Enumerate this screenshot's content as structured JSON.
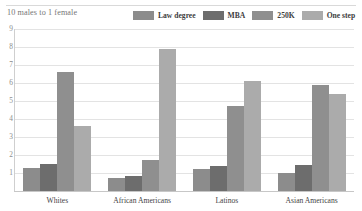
{
  "chart_data": {
    "type": "bar",
    "title": "10 males to 1 female",
    "xlabel": "",
    "ylabel": "",
    "ylim": [
      0,
      9
    ],
    "yticks": [
      1,
      2,
      3,
      4,
      5,
      6,
      7,
      8,
      9
    ],
    "grid": true,
    "legend_position": "top-right",
    "categories": [
      "Whites",
      "African Americans",
      "Latinos",
      "Asian Americans"
    ],
    "series": [
      {
        "name": "Law degree",
        "color": "#8c8c8c",
        "values": [
          1.3,
          0.75,
          1.2,
          1.0
        ]
      },
      {
        "name": "MBA",
        "color": "#6d6d6d",
        "values": [
          1.5,
          0.85,
          1.4,
          1.45
        ]
      },
      {
        "name": "250K",
        "color": "#8f8f8f",
        "values": [
          6.6,
          1.75,
          4.7,
          5.9
        ]
      },
      {
        "name": "One step",
        "color": "#ababab",
        "values": [
          3.6,
          7.9,
          6.1,
          5.4
        ]
      }
    ]
  },
  "colors": {
    "gridline": "#e3e3e3",
    "axis": "#c7c7c7",
    "title_text": "#777777",
    "tick_text": "#8d8d8d",
    "label_text": "#444444"
  }
}
